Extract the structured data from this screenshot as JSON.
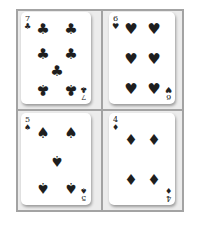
{
  "cards": [
    {
      "rank": "7",
      "suit": "clubs",
      "suit_symbol": "♣"
    },
    {
      "rank": "6",
      "suit": "hearts",
      "suit_symbol": "♥"
    },
    {
      "rank": "5",
      "suit": "spades",
      "suit_symbol": "♠"
    },
    {
      "rank": "4",
      "suit": "diamonds",
      "suit_symbol": "♦"
    }
  ],
  "colors": {
    "frame": "#a3a3a3",
    "card": "#ffffff",
    "pip": "#1e1e1e"
  }
}
